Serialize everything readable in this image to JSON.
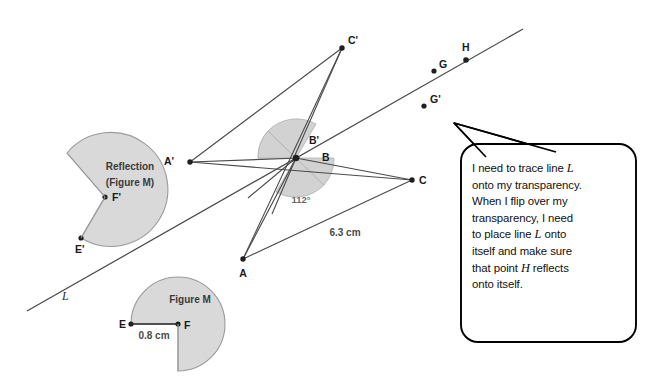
{
  "figure": {
    "type": "geometry-diagram",
    "background_color": "#ffffff",
    "shape_fill": "#d9d9d9",
    "shape_stroke": "#808080",
    "line_stroke": "#4a4a4a"
  },
  "line_L": {
    "label": "L",
    "label_x": 62,
    "label_y": 296,
    "x1": 27,
    "y1": 311,
    "x2": 523,
    "y2": 29
  },
  "points": [
    {
      "name": "A'",
      "label": "A'",
      "x": 190,
      "y": 162,
      "lx": 176,
      "ly": 160
    },
    {
      "name": "A",
      "label": "A",
      "x": 243,
      "y": 259,
      "lx": 239,
      "ly": 275
    },
    {
      "name": "B'",
      "label": "B'",
      "x": 296,
      "y": 158,
      "lx": 311,
      "ly": 143
    },
    {
      "name": "B",
      "label": "B",
      "x": 296,
      "y": 158,
      "lx": 325,
      "ly": 159
    },
    {
      "name": "C'",
      "label": "C'",
      "x": 342,
      "y": 48,
      "lx": 348,
      "ly": 43
    },
    {
      "name": "C",
      "label": "C",
      "x": 412,
      "y": 180,
      "lx": 419,
      "ly": 182
    },
    {
      "name": "G",
      "label": "G",
      "x": 434,
      "y": 71,
      "lx": 439,
      "ly": 66
    },
    {
      "name": "G'",
      "label": "G'",
      "x": 424,
      "y": 106,
      "lx": 430,
      "ly": 102
    },
    {
      "name": "H",
      "label": "H",
      "x": 466,
      "y": 60,
      "lx": 461,
      "ly": 49
    },
    {
      "name": "F'",
      "label": "F'",
      "x": 105,
      "y": 197,
      "lx": 111,
      "ly": 201
    },
    {
      "name": "E'",
      "label": "E'",
      "x": 81,
      "y": 238,
      "lx": 75,
      "ly": 252
    },
    {
      "name": "E",
      "label": "E",
      "x": 131,
      "y": 324,
      "lx": 121,
      "ly": 327
    },
    {
      "name": "F",
      "label": "F",
      "x": 178,
      "y": 324,
      "lx": 183,
      "ly": 328
    }
  ],
  "segments": [
    {
      "name": "A-prime-to-C-prime",
      "x1": 190,
      "y1": 162,
      "x2": 342,
      "y2": 48
    },
    {
      "name": "A-prime-to-B",
      "x1": 190,
      "y1": 162,
      "x2": 296,
      "y2": 158
    },
    {
      "name": "A-prime-to-C",
      "x1": 190,
      "y1": 162,
      "x2": 412,
      "y2": 180
    },
    {
      "name": "C-prime-to-B",
      "x1": 342,
      "y1": 48,
      "x2": 296,
      "y2": 158
    },
    {
      "name": "C-prime-to-A",
      "x1": 342,
      "y1": 48,
      "x2": 243,
      "y2": 259
    },
    {
      "name": "A-to-B",
      "x1": 243,
      "y1": 259,
      "x2": 296,
      "y2": 158
    },
    {
      "name": "A-to-C",
      "x1": 243,
      "y1": 259,
      "x2": 412,
      "y2": 180
    },
    {
      "name": "B-to-C",
      "x1": 296,
      "y1": 158,
      "x2": 412,
      "y2": 180
    },
    {
      "name": "B-extension-left",
      "x1": 296,
      "y1": 158,
      "x2": 250,
      "y2": 196
    }
  ],
  "angle_measure": {
    "value": "112°",
    "x": 301,
    "y": 200
  },
  "length_measures": [
    {
      "name": "AC-length",
      "value": "6.3 cm",
      "x": 345,
      "y": 232
    },
    {
      "name": "EF-length",
      "value": "0.8 cm",
      "x": 152,
      "y": 337
    }
  ],
  "shapes": [
    {
      "name": "reflection-figure-m",
      "label_line1": "Reflection",
      "label_line2": "(Figure M)",
      "label_x": 130,
      "label_y1": 166,
      "label_y2": 182
    },
    {
      "name": "figure-m",
      "label": "Figure M",
      "label_x": 190,
      "label_y": 299
    }
  ],
  "speech_bubble": {
    "name": "student-speech-bubble",
    "text": "I need to trace line L onto my transparency. When I flip over my transparency, I need to place line L onto itself and make sure that point H reflects onto itself.",
    "lines": [
      "I need to trace line L",
      "onto my transparency.",
      "When I flip over my",
      "transparency, I need",
      "to place line L onto",
      "itself and make sure",
      "that point H reflects",
      "onto itself."
    ],
    "tail_tip_x": 454,
    "tail_tip_y": 123,
    "border_color": "#000000",
    "fill_color": "#ffffff"
  }
}
